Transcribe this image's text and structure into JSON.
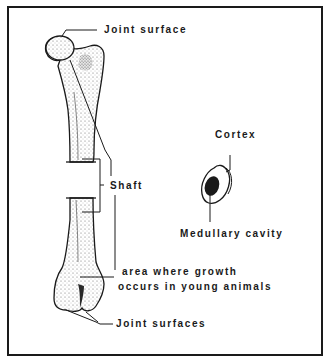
{
  "diagram": {
    "type": "labeled-anatomy-illustration",
    "labels": {
      "joint_surface_top": "Joint surface",
      "shaft": "Shaft",
      "cortex": "Cortex",
      "medullary_cavity": "Medullary cavity",
      "growth_area_line1": "area where growth",
      "growth_area_line2": "occurs in young animals",
      "joint_surfaces_bottom": "Joint surfaces"
    },
    "colors": {
      "ink": "#1a1a1a",
      "background": "#ffffff",
      "stipple": "#8a8a8a"
    }
  }
}
